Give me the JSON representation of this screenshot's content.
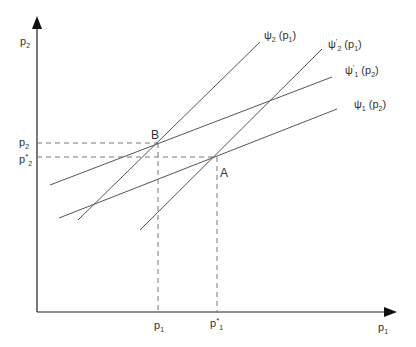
{
  "diagram": {
    "colors": {
      "axis": "#222222",
      "curve": "#555555",
      "dash": "#777777",
      "text": "#333333"
    },
    "axes": {
      "y_label": {
        "base": "p",
        "sub": "2"
      },
      "x_label": {
        "base": "p",
        "sub": "1"
      }
    },
    "curves": [
      {
        "id": "psi2",
        "label": {
          "base": "ψ",
          "prime": "",
          "sub": "2",
          "arg": "(p",
          "argsub": "1",
          "close": ")"
        }
      },
      {
        "id": "psi2prime",
        "label": {
          "base": "ψ",
          "prime": "'",
          "sub": "2",
          "arg": "(p",
          "argsub": "1",
          "close": ")"
        }
      },
      {
        "id": "psi1prime",
        "label": {
          "base": "ψ",
          "prime": "'",
          "sub": "1",
          "arg": "(p",
          "argsub": "2",
          "close": ")"
        }
      },
      {
        "id": "psi1",
        "label": {
          "base": "ψ",
          "prime": "",
          "sub": "1",
          "arg": "(p",
          "argsub": "2",
          "close": ")"
        }
      }
    ],
    "points": {
      "B": "B",
      "A": "A"
    },
    "ticks": {
      "y": [
        {
          "base": "p",
          "star": "",
          "sub": "2"
        },
        {
          "base": "p",
          "star": "*",
          "sub": "2"
        }
      ],
      "x": [
        {
          "base": "p",
          "star": "",
          "sub": "1"
        },
        {
          "base": "p",
          "star": "*",
          "sub": "1"
        }
      ]
    }
  }
}
